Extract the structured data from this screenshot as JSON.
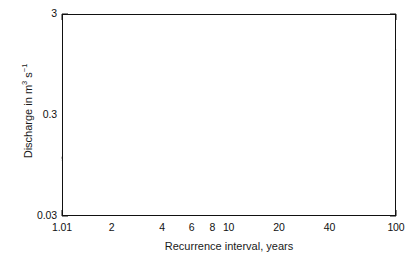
{
  "chart_data": {
    "type": "scatter",
    "title": "",
    "xlabel": "Recurrence interval, years",
    "ylabel_parts": {
      "pre": "Discharge in m",
      "sup1": "3",
      "mid": " s",
      "sup2": "−1"
    },
    "ylabel": "Discharge in m3 s-1",
    "xscale": "log",
    "yscale": "log",
    "xlim": [
      1.01,
      100
    ],
    "ylim": [
      0.03,
      3
    ],
    "grid": false,
    "legend": null,
    "xticks_major": [
      {
        "value": 1.01,
        "label": "1.01"
      },
      {
        "value": 2,
        "label": "2"
      },
      {
        "value": 4,
        "label": "4"
      },
      {
        "value": 6,
        "label": "6"
      },
      {
        "value": 8,
        "label": "8"
      },
      {
        "value": 10,
        "label": "10"
      },
      {
        "value": 20,
        "label": "20"
      },
      {
        "value": 40,
        "label": "40"
      },
      {
        "value": 100,
        "label": "100"
      }
    ],
    "xticks_minor": [
      1.2,
      1.5,
      3,
      5,
      7,
      9,
      30,
      50,
      60,
      70,
      80,
      90
    ],
    "yticks_major": [
      {
        "value": 3,
        "label": "3"
      },
      {
        "value": 0.3,
        "label": "0.3"
      },
      {
        "value": 0.03,
        "label": "0.03"
      }
    ],
    "yticks_minor": [
      2,
      1.5,
      1,
      0.7,
      0.5,
      0.4,
      0.2,
      0.15,
      0.1,
      0.07,
      0.05,
      0.04
    ],
    "marker": "open-circle",
    "marker_size_px": 5.2,
    "line_color": "#111111",
    "marker_color": "#111111",
    "series": [
      {
        "name": "observations",
        "points": [
          [
            1.05,
            0.113
          ],
          [
            1.1,
            0.123
          ],
          [
            1.14,
            0.13
          ],
          [
            1.18,
            0.136
          ],
          [
            1.22,
            0.142
          ],
          [
            1.27,
            0.17
          ],
          [
            1.32,
            0.176
          ],
          [
            1.38,
            0.182
          ],
          [
            1.43,
            0.186
          ],
          [
            1.47,
            0.188
          ],
          [
            1.51,
            0.19
          ],
          [
            1.55,
            0.19
          ],
          [
            1.6,
            0.186
          ],
          [
            1.66,
            0.19
          ],
          [
            1.73,
            0.208
          ],
          [
            1.8,
            0.214
          ],
          [
            1.88,
            0.216
          ],
          [
            1.96,
            0.218
          ],
          [
            2.05,
            0.212
          ],
          [
            2.14,
            0.226
          ],
          [
            2.24,
            0.24
          ],
          [
            2.33,
            0.248
          ],
          [
            2.42,
            0.256
          ],
          [
            2.52,
            0.262
          ],
          [
            2.62,
            0.272
          ],
          [
            2.74,
            0.285
          ],
          [
            2.86,
            0.3
          ],
          [
            2.98,
            0.318
          ],
          [
            3.12,
            0.316
          ],
          [
            3.28,
            0.32
          ],
          [
            3.46,
            0.33
          ],
          [
            3.64,
            0.345
          ],
          [
            3.84,
            0.356
          ],
          [
            4.06,
            0.36
          ],
          [
            4.32,
            0.386
          ],
          [
            4.6,
            0.398
          ],
          [
            4.92,
            0.404
          ],
          [
            5.3,
            0.43
          ],
          [
            5.75,
            0.452
          ],
          [
            6.3,
            0.52
          ],
          [
            7.1,
            0.555
          ],
          [
            7.9,
            0.548
          ],
          [
            9.4,
            0.6
          ],
          [
            13.0,
            0.64
          ],
          [
            19.5,
            0.64
          ],
          [
            62.0,
            1.08
          ]
        ]
      }
    ],
    "fit_line": {
      "name": "regression",
      "x": [
        1.01,
        100
      ],
      "y": [
        0.105,
        1.34
      ]
    }
  }
}
